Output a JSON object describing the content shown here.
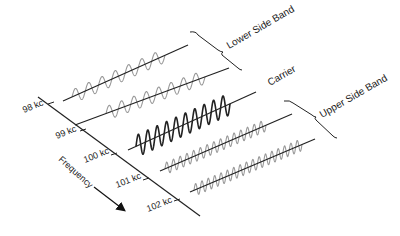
{
  "diagram": {
    "type": "am-sidebands-spectrum",
    "axis": {
      "label": "Frequency",
      "ticks": [
        "98 kc",
        "99 kc",
        "100 kc",
        "101 kc",
        "102 kc"
      ]
    },
    "waves": [
      {
        "id": "lower-2",
        "freq": "98 kc",
        "band": "lower",
        "color": "#999999",
        "cycles": 7
      },
      {
        "id": "lower-1",
        "freq": "99 kc",
        "band": "lower",
        "color": "#999999",
        "cycles": 8
      },
      {
        "id": "carrier",
        "freq": "100 kc",
        "band": "carrier",
        "color": "#222222",
        "cycles": 10
      },
      {
        "id": "upper-1",
        "freq": "101 kc",
        "band": "upper",
        "color": "#999999",
        "cycles": 15
      },
      {
        "id": "upper-2",
        "freq": "102 kc",
        "band": "upper",
        "color": "#999999",
        "cycles": 17
      }
    ],
    "labels": {
      "lower": "Lower Side Band",
      "carrier": "Carrier",
      "upper": "Upper Side Band"
    }
  }
}
